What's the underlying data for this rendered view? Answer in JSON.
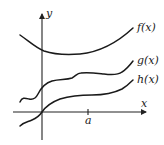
{
  "diagram": {
    "axes": {
      "x_label": "x",
      "y_label": "y",
      "tick_label": "a"
    },
    "curves": [
      {
        "name": "f",
        "label": "f(x)"
      },
      {
        "name": "g",
        "label": "g(x)"
      },
      {
        "name": "h",
        "label": "h(x)"
      }
    ]
  }
}
